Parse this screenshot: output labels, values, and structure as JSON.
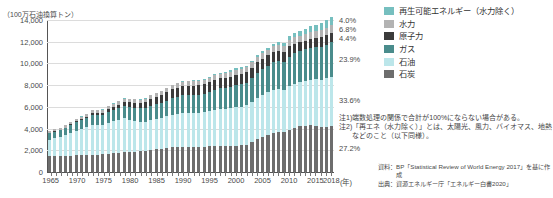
{
  "axis": {
    "unit_label": "（100万石油換算トン）",
    "x_unit": "(年)",
    "y_ticks": [
      "14,000",
      "12,000",
      "10,000",
      "8,000",
      "6,000",
      "4,000",
      "2,000",
      "0"
    ],
    "x_labels": [
      "1965",
      "1970",
      "1975",
      "1980",
      "1985",
      "1990",
      "1995",
      "2000",
      "2005",
      "2010",
      "2015",
      "2018"
    ]
  },
  "legend": {
    "items": [
      {
        "label": "再生可能エネルギー（水力除く）",
        "color": "#76bfbf"
      },
      {
        "label": "水力",
        "color": "#b3b3b3"
      },
      {
        "label": "原子力",
        "color": "#3b3b3b"
      },
      {
        "label": "ガス",
        "color": "#4a8c8c"
      },
      {
        "label": "石油",
        "color": "#bce6ea"
      },
      {
        "label": "石炭",
        "color": "#6d6d6d"
      }
    ]
  },
  "callouts": [
    {
      "value": "4.0%",
      "series": "再生可能エネルギー（水力除く）"
    },
    {
      "value": "6.8%",
      "series": "水力"
    },
    {
      "value": "4.4%",
      "series": "原子力"
    },
    {
      "value": "23.9%",
      "series": "ガス"
    },
    {
      "value": "33.6%",
      "series": "石油"
    },
    {
      "value": "27.2%",
      "series": "石炭"
    }
  ],
  "notes": [
    {
      "mark": "注1)",
      "text": "端数処理の関係で合計が100%にならない場合がある。"
    },
    {
      "mark": "注2)",
      "text": "「再エネ（水力除く）」とは、太陽光、風力、バイオマス、地熱などのこと（以下同様）。"
    }
  ],
  "sources": [
    {
      "label": "資料：",
      "text": "BP「Statistical Review of World Energy 2017」を基に作成"
    },
    {
      "label": "出典：",
      "text": "資源エネルギー庁「エネルギー白書2020」"
    }
  ],
  "chart_data": {
    "type": "bar",
    "stacked": true,
    "title": "",
    "xlabel": "(年)",
    "ylabel": "（100万石油換算トン）",
    "ylim": [
      0,
      14000
    ],
    "ytick_step": 2000,
    "grid": true,
    "legend_position": "right",
    "x": [
      1965,
      1966,
      1967,
      1968,
      1969,
      1970,
      1971,
      1972,
      1973,
      1974,
      1975,
      1976,
      1977,
      1978,
      1979,
      1980,
      1981,
      1982,
      1983,
      1984,
      1985,
      1986,
      1987,
      1988,
      1989,
      1990,
      1991,
      1992,
      1993,
      1994,
      1995,
      1996,
      1997,
      1998,
      1999,
      2000,
      2001,
      2002,
      2003,
      2004,
      2005,
      2006,
      2007,
      2008,
      2009,
      2010,
      2011,
      2012,
      2013,
      2014,
      2015,
      2016,
      2017,
      2018
    ],
    "series": [
      {
        "name": "石炭",
        "color": "#6d6d6d",
        "values": [
          1450,
          1460,
          1440,
          1470,
          1510,
          1540,
          1530,
          1550,
          1590,
          1610,
          1620,
          1680,
          1730,
          1760,
          1840,
          1850,
          1860,
          1890,
          1930,
          2020,
          2110,
          2150,
          2220,
          2300,
          2340,
          2350,
          2320,
          2280,
          2290,
          2310,
          2370,
          2430,
          2440,
          2400,
          2390,
          2420,
          2450,
          2530,
          2800,
          3030,
          3250,
          3440,
          3620,
          3720,
          3700,
          3900,
          4100,
          4200,
          4270,
          4290,
          4230,
          4150,
          4180,
          4250
        ]
      },
      {
        "name": "石油",
        "color": "#bce6ea",
        "values": [
          1530,
          1650,
          1760,
          1900,
          2070,
          2260,
          2390,
          2560,
          2760,
          2720,
          2690,
          2860,
          2950,
          3040,
          3120,
          2980,
          2840,
          2760,
          2720,
          2750,
          2750,
          2850,
          2900,
          2980,
          3030,
          3080,
          3100,
          3140,
          3130,
          3190,
          3230,
          3310,
          3400,
          3430,
          3510,
          3560,
          3580,
          3600,
          3690,
          3830,
          3880,
          3920,
          3970,
          3940,
          3880,
          3990,
          4030,
          4080,
          4120,
          4180,
          4300,
          4370,
          4440,
          4490
        ]
      },
      {
        "name": "ガス",
        "color": "#4a8c8c",
        "values": [
          570,
          600,
          640,
          690,
          750,
          800,
          860,
          900,
          940,
          960,
          960,
          1020,
          1040,
          1080,
          1150,
          1180,
          1200,
          1210,
          1230,
          1320,
          1360,
          1380,
          1450,
          1520,
          1580,
          1640,
          1670,
          1680,
          1700,
          1710,
          1760,
          1860,
          1860,
          1890,
          1940,
          2020,
          2050,
          2100,
          2180,
          2260,
          2330,
          2400,
          2510,
          2560,
          2520,
          2720,
          2790,
          2860,
          2900,
          2930,
          2980,
          3030,
          3120,
          3200
        ]
      },
      {
        "name": "原子力",
        "color": "#3b3b3b",
        "values": [
          20,
          25,
          30,
          40,
          50,
          60,
          80,
          100,
          120,
          150,
          200,
          240,
          290,
          320,
          350,
          400,
          470,
          480,
          530,
          620,
          700,
          730,
          780,
          820,
          830,
          840,
          860,
          870,
          880,
          890,
          900,
          920,
          920,
          930,
          950,
          960,
          970,
          970,
          950,
          980,
          990,
          990,
          970,
          970,
          960,
          980,
          900,
          800,
          810,
          830,
          840,
          850,
          860,
          860
        ]
      },
      {
        "name": "水力",
        "color": "#b3b3b3",
        "values": [
          200,
          210,
          215,
          225,
          235,
          245,
          250,
          255,
          260,
          270,
          280,
          285,
          295,
          305,
          310,
          315,
          320,
          325,
          335,
          345,
          355,
          360,
          370,
          375,
          380,
          390,
          395,
          400,
          415,
          420,
          430,
          440,
          445,
          450,
          455,
          470,
          465,
          470,
          470,
          490,
          500,
          520,
          530,
          550,
          570,
          590,
          590,
          620,
          640,
          660,
          670,
          690,
          700,
          720
        ]
      },
      {
        "name": "再生可能エネルギー（水力除く）",
        "color": "#76bfbf",
        "values": [
          5,
          5,
          6,
          6,
          7,
          8,
          9,
          10,
          11,
          12,
          14,
          15,
          17,
          18,
          20,
          22,
          24,
          26,
          29,
          32,
          35,
          38,
          42,
          46,
          50,
          55,
          60,
          64,
          70,
          75,
          82,
          88,
          95,
          102,
          110,
          120,
          128,
          138,
          150,
          165,
          182,
          200,
          225,
          255,
          285,
          325,
          370,
          420,
          470,
          520,
          570,
          620,
          680,
          740
        ]
      }
    ]
  }
}
